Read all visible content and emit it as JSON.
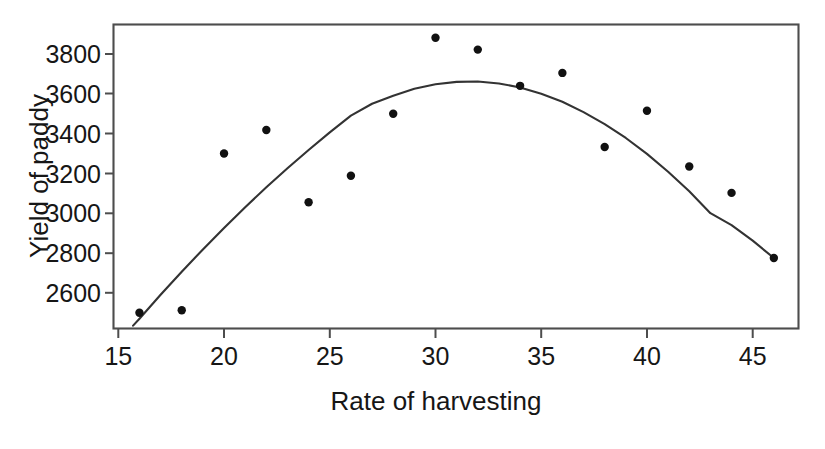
{
  "chart_data": {
    "type": "scatter",
    "title": "",
    "xlabel": "Rate of harvesting",
    "ylabel": "Yield of paddy",
    "xlim": [
      14.8,
      47.1
    ],
    "ylim": [
      2460,
      3930
    ],
    "xticks": [
      15,
      20,
      25,
      30,
      35,
      40,
      45
    ],
    "xticklabels": [
      "15",
      "20",
      "25",
      "30",
      "35",
      "40",
      "45"
    ],
    "yticks": [
      2600,
      2800,
      3000,
      3200,
      3400,
      3600,
      3800
    ],
    "yticklabels": [
      "2600",
      "2800",
      "3000",
      "3200",
      "3400",
      "3600",
      "3800"
    ],
    "grid": false,
    "legend": null,
    "x": [
      16,
      18,
      20,
      22,
      24,
      26,
      28,
      30,
      32,
      34,
      36,
      38,
      40,
      42,
      44,
      46
    ],
    "y": [
      2500,
      2512,
      3300,
      3418,
      3055,
      3188,
      3500,
      3882,
      3822,
      3640,
      3705,
      3333,
      3515,
      3235,
      3102,
      2775
    ],
    "series": [
      {
        "name": "Observed yield",
        "marker": "filled-circle",
        "color": "#111111",
        "values": [
          2500,
          2512,
          3300,
          3418,
          3055,
          3188,
          3500,
          3882,
          3822,
          3640,
          3705,
          3333,
          3515,
          3235,
          3102,
          2775
        ]
      }
    ],
    "fit_curve": {
      "name": "Quadratic fit",
      "type": "quadratic",
      "color": "#333333",
      "vertex_x": 32,
      "vertex_y": 3660,
      "points_x": [
        15.7,
        16,
        17,
        18,
        19,
        20,
        21,
        22,
        23,
        24,
        25,
        26,
        27,
        28,
        29,
        30,
        31,
        32,
        33,
        34,
        35,
        36,
        37,
        38,
        39,
        40,
        41,
        42,
        43,
        44,
        45,
        46
      ],
      "points_y": [
        2435,
        2470,
        2590,
        2706,
        2818,
        2926,
        3030,
        3130,
        3226,
        3318,
        3406,
        3490,
        3550,
        3590,
        3625,
        3648,
        3660,
        3662,
        3652,
        3632,
        3600,
        3560,
        3508,
        3448,
        3378,
        3298,
        3208,
        3110,
        3000,
        2940,
        2862,
        2775
      ]
    }
  },
  "axis": {
    "x_title": "Rate of harvesting",
    "y_title": "Yield of paddy"
  }
}
